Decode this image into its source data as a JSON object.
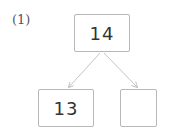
{
  "problem_label": "(1)",
  "top_box": {
    "value": "14"
  },
  "bottom_left_box": {
    "value": "13"
  },
  "bottom_right_box": {
    "value": ""
  },
  "colors": {
    "border": "#b8b8b8",
    "arrow": "#c4c4c4",
    "text": "#333333"
  }
}
